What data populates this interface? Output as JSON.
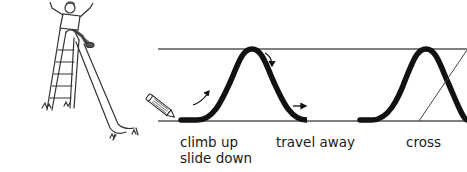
{
  "illustration": {
    "subject": "child sitting on top of playground slide with arms raised"
  },
  "diagram": {
    "guide_lines": {
      "color": "#555555"
    },
    "stroke_color": "#111111",
    "labels": {
      "climb_up": "climb up",
      "slide_down": "slide down",
      "travel_away": "travel away",
      "cross": "cross"
    },
    "icons": [
      "pencil-icon",
      "curved-arrow-up-icon",
      "curved-arrow-down-icon",
      "arrow-right-icon"
    ]
  }
}
